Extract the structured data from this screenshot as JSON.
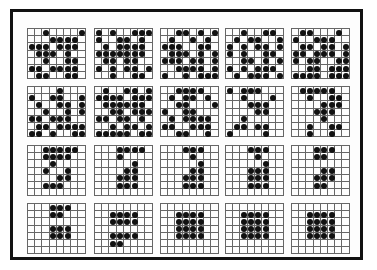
{
  "figure": {
    "grid_cols": 8,
    "grid_rows": 7,
    "panels": [
      {
        "id": 1,
        "rows": [
          "00100001",
          "00011110",
          "11101110",
          "01110100",
          "00100110",
          "11011110",
          "01100110"
        ]
      },
      {
        "id": 2,
        "rows": [
          "10100111",
          "10011010",
          "01011110",
          "11111110",
          "01101100",
          "10101101",
          "00100110"
        ]
      },
      {
        "id": 3,
        "rows": [
          "00110101",
          "01001010",
          "11100110",
          "01110101",
          "11101101",
          "00111101",
          "10010111"
        ]
      },
      {
        "id": 4,
        "rows": [
          "00100110",
          "01011001",
          "10101101",
          "10100110",
          "00110101",
          "10101110",
          "01011101"
        ]
      },
      {
        "id": 5,
        "rows": [
          "01100010",
          "10011100",
          "01101101",
          "11011101",
          "10110011",
          "00110111",
          "11110111"
        ]
      },
      {
        "id": 6,
        "rows": [
          "00001000",
          "10011001",
          "01001101",
          "00100101",
          "11011100",
          "01101111",
          "11010011"
        ]
      },
      {
        "id": 7,
        "rows": [
          "01001101",
          "11110111",
          "01111110",
          "00110111",
          "11011010",
          "00101101",
          "11111011"
        ]
      },
      {
        "id": 8,
        "rows": [
          "00111100",
          "01011010",
          "00110001",
          "10011000",
          "01011110",
          "11001110",
          "00110010"
        ]
      },
      {
        "id": 9,
        "rows": [
          "10111000",
          "00100010",
          "00011100",
          "00001100",
          "00100000",
          "01101100",
          "10000100"
        ]
      },
      {
        "id": 10,
        "rows": [
          "01111100",
          "00100110",
          "00001110",
          "00011100",
          "00001000",
          "00100110",
          "00100100"
        ]
      },
      {
        "id": 11,
        "rows": [
          "00111110",
          "00111100",
          "00010000",
          "00100100",
          "00001100",
          "00111000",
          "00000000"
        ]
      },
      {
        "id": 12,
        "rows": [
          "00011110",
          "00010000",
          "00000100",
          "00001100",
          "00011100",
          "00011100",
          "00000000"
        ]
      },
      {
        "id": 13,
        "rows": [
          "00011100",
          "00001000",
          "00000100",
          "00001100",
          "00011100",
          "00011100",
          "00000000"
        ]
      },
      {
        "id": 14,
        "rows": [
          "00011100",
          "00001000",
          "00000100",
          "00011100",
          "00011100",
          "00011100",
          "00000000"
        ]
      },
      {
        "id": 15,
        "rows": [
          "00011100",
          "00011000",
          "00000000",
          "00001100",
          "00011100",
          "00011000",
          "00000000"
        ]
      },
      {
        "id": 16,
        "rows": [
          "00011100",
          "00011000",
          "00000000",
          "00011100",
          "00011100",
          "00000000",
          "00000000"
        ]
      },
      {
        "id": 17,
        "rows": [
          "00000000",
          "00111100",
          "00111100",
          "00000000",
          "00111100",
          "00110000",
          "00000000"
        ]
      },
      {
        "id": 18,
        "rows": [
          "00000000",
          "00111100",
          "00111100",
          "00111100",
          "00111100",
          "00000000",
          "00000000"
        ]
      },
      {
        "id": 19,
        "rows": [
          "00000000",
          "00111100",
          "00111100",
          "00111100",
          "00111100",
          "00000000",
          "00000000"
        ]
      },
      {
        "id": 20,
        "rows": [
          "00000000",
          "00111100",
          "00111100",
          "00111100",
          "00111100",
          "00000000",
          "00000000"
        ]
      }
    ]
  }
}
